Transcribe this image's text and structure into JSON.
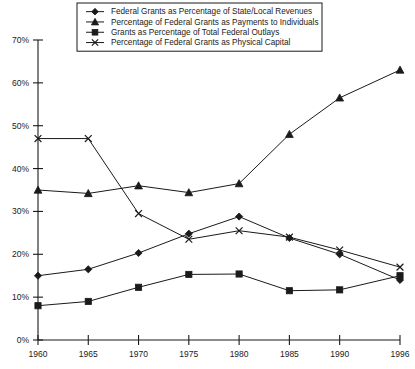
{
  "chart_data": {
    "type": "line",
    "title": "",
    "xlabel": "",
    "ylabel": "",
    "x": [
      1960,
      1965,
      1970,
      1975,
      1980,
      1985,
      1990,
      1996
    ],
    "xtick_labels": [
      "1960",
      "1965",
      "1970",
      "1975",
      "1980",
      "1985",
      "1990",
      "1996"
    ],
    "ytick_labels": [
      "0%",
      "10%",
      "20%",
      "30%",
      "40%",
      "50%",
      "60%",
      "70%"
    ],
    "ytick_values": [
      0,
      10,
      20,
      30,
      40,
      50,
      60,
      70
    ],
    "ylim": [
      0,
      70
    ],
    "xlim": [
      1960,
      1996
    ],
    "grid": false,
    "legend_position": "top-right",
    "series": [
      {
        "name": "Federal Grants as Percentage of State/Local Revenues",
        "marker": "diamond",
        "values": [
          15.0,
          16.5,
          20.3,
          24.8,
          28.8,
          23.8,
          20.0,
          14.0
        ]
      },
      {
        "name": "Percentage of Federal Grants as Payments to Individuals",
        "marker": "triangle",
        "values": [
          35.0,
          34.2,
          36.0,
          34.4,
          36.5,
          48.0,
          56.5,
          63.0
        ]
      },
      {
        "name": "Grants as Percentage of Total Federal Outlays",
        "marker": "square",
        "values": [
          8.0,
          9.0,
          12.3,
          15.3,
          15.4,
          11.5,
          11.7,
          15.0
        ]
      },
      {
        "name": "Percentage of Federal Grants as Physical Capital",
        "marker": "x",
        "values": [
          47.0,
          47.0,
          29.5,
          23.5,
          25.5,
          24.0,
          21.0,
          17.0
        ]
      }
    ]
  },
  "colors": {
    "ink": "#1a1a1a",
    "background": "#ffffff"
  }
}
